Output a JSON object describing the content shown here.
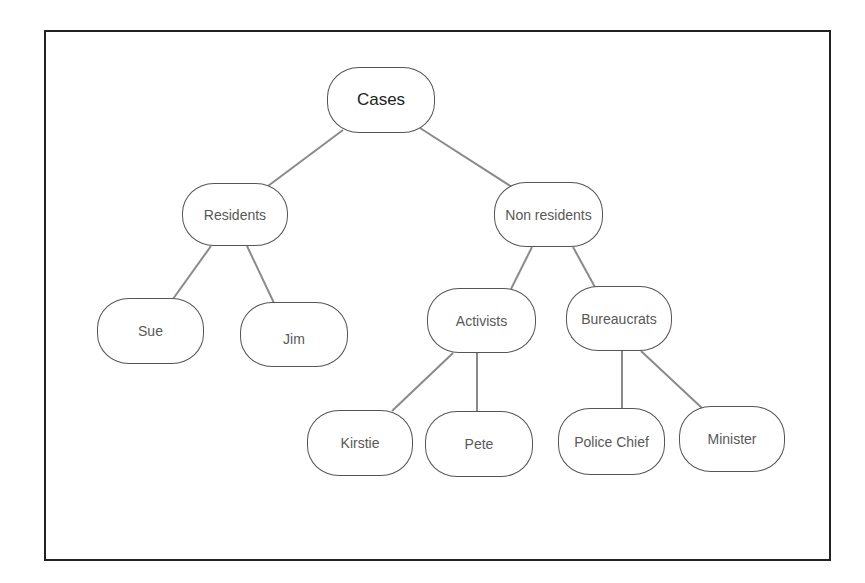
{
  "diagram": {
    "type": "tree",
    "title": "",
    "colors": {
      "frame": "#222222",
      "node_border": "#555555",
      "edge": "#8a8a8a",
      "root_text": "#222222",
      "node_text": "#585858"
    },
    "nodes": {
      "cases": "Cases",
      "residents": "Residents",
      "non_residents": "Non residents",
      "sue": "Sue",
      "jim": "Jim",
      "activists": "Activists",
      "bureaucrats": "Bureaucrats",
      "kirstie": "Kirstie",
      "pete": "Pete",
      "police_chief": "Police Chief",
      "minister": "Minister"
    },
    "edges": [
      [
        "Cases",
        "Residents"
      ],
      [
        "Cases",
        "Non residents"
      ],
      [
        "Residents",
        "Sue"
      ],
      [
        "Residents",
        "Jim"
      ],
      [
        "Non residents",
        "Activists"
      ],
      [
        "Non residents",
        "Bureaucrats"
      ],
      [
        "Activists",
        "Kirstie"
      ],
      [
        "Activists",
        "Pete"
      ],
      [
        "Bureaucrats",
        "Police Chief"
      ],
      [
        "Bureaucrats",
        "Minister"
      ]
    ]
  }
}
